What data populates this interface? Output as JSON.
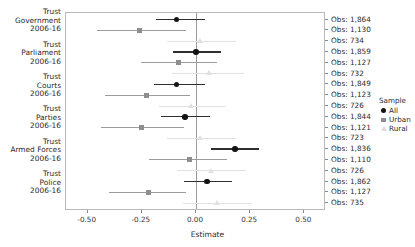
{
  "chart_data": {
    "type": "scatter",
    "subtype": "forest-plot",
    "title": "",
    "xlabel": "Estimate",
    "ylabel": "",
    "xlim": [
      -0.6,
      0.6
    ],
    "xticks": [
      -0.5,
      -0.25,
      0.0,
      0.25,
      0.5
    ],
    "xticklabels": [
      "-0.50",
      "-0.25",
      "0.00",
      "0.25",
      "0.50"
    ],
    "grid": false,
    "reference_line": 0.0,
    "legend": {
      "title": "Sample",
      "position": "right",
      "entries": [
        {
          "label": "All",
          "marker": "circle",
          "color": "#141414"
        },
        {
          "label": "Urban",
          "marker": "square",
          "color": "#8e8e8e"
        },
        {
          "label": "Rural",
          "marker": "triangle",
          "color": "#dcdcdc"
        }
      ]
    },
    "groups": [
      {
        "label_lines": [
          "Trust",
          "Government",
          "2006-16"
        ],
        "rows": [
          {
            "sample": "All",
            "estimate": -0.09,
            "ci_low": -0.185,
            "ci_high": 0.04,
            "obs": "Obs: 1,864"
          },
          {
            "sample": "Urban",
            "estimate": -0.26,
            "ci_low": -0.455,
            "ci_high": -0.048,
            "obs": "Obs: 1,130"
          },
          {
            "sample": "Rural",
            "estimate": 0.02,
            "ci_low": -0.135,
            "ci_high": 0.185,
            "obs": "Obs: 734"
          }
        ]
      },
      {
        "label_lines": [
          "Trust",
          "Parliament",
          "2006-16"
        ],
        "rows": [
          {
            "sample": "All",
            "estimate": 0.0,
            "ci_low": -0.105,
            "ci_high": 0.115,
            "obs": "Obs: 1,859"
          },
          {
            "sample": "Urban",
            "estimate": -0.08,
            "ci_low": -0.255,
            "ci_high": 0.095,
            "obs": "Obs: 1,127"
          },
          {
            "sample": "Rural",
            "estimate": 0.06,
            "ci_low": -0.11,
            "ci_high": 0.22,
            "obs": "Obs: 732"
          }
        ]
      },
      {
        "label_lines": [
          "Trust",
          "Courts",
          "2006-16"
        ],
        "rows": [
          {
            "sample": "All",
            "estimate": -0.09,
            "ci_low": -0.195,
            "ci_high": 0.04,
            "obs": "Obs: 1,849"
          },
          {
            "sample": "Urban",
            "estimate": -0.23,
            "ci_low": -0.42,
            "ci_high": -0.03,
            "obs": "Obs: 1,123"
          },
          {
            "sample": "Rural",
            "estimate": -0.02,
            "ci_low": -0.17,
            "ci_high": 0.14,
            "obs": "Obs: 726"
          }
        ]
      },
      {
        "label_lines": [
          "Trust",
          "Parties",
          "2006-16"
        ],
        "rows": [
          {
            "sample": "All",
            "estimate": -0.05,
            "ci_low": -0.16,
            "ci_high": 0.065,
            "obs": "Obs: 1,844"
          },
          {
            "sample": "Urban",
            "estimate": -0.25,
            "ci_low": -0.44,
            "ci_high": -0.055,
            "obs": "Obs: 1,121"
          },
          {
            "sample": "Rural",
            "estimate": 0.02,
            "ci_low": -0.135,
            "ci_high": 0.185,
            "obs": "Obs: 723"
          }
        ]
      },
      {
        "label_lines": [
          "Trust",
          "Armed Forces",
          "2006-16"
        ],
        "rows": [
          {
            "sample": "All",
            "estimate": 0.18,
            "ci_low": 0.07,
            "ci_high": 0.29,
            "obs": "Obs: 1,836"
          },
          {
            "sample": "Urban",
            "estimate": -0.03,
            "ci_low": -0.215,
            "ci_high": 0.145,
            "obs": "Obs: 1,110"
          },
          {
            "sample": "Rural",
            "estimate": 0.07,
            "ci_low": -0.09,
            "ci_high": 0.23,
            "obs": "Obs: 726"
          }
        ]
      },
      {
        "label_lines": [
          "Trust",
          "Police",
          "2006-16"
        ],
        "rows": [
          {
            "sample": "All",
            "estimate": 0.05,
            "ci_low": -0.055,
            "ci_high": 0.165,
            "obs": "Obs: 1,862"
          },
          {
            "sample": "Urban",
            "estimate": -0.22,
            "ci_low": -0.4,
            "ci_high": -0.045,
            "obs": "Obs: 1,127"
          },
          {
            "sample": "Rural",
            "estimate": 0.1,
            "ci_low": -0.06,
            "ci_high": 0.26,
            "obs": "Obs: 735"
          }
        ]
      }
    ]
  }
}
